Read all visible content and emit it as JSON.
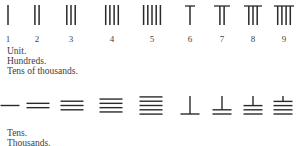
{
  "figure": {
    "vertical_numerals": {
      "digits": [
        1,
        2,
        3,
        4,
        5,
        6,
        7,
        8,
        9
      ],
      "labels": [
        "1",
        "2",
        "3",
        "4",
        "5",
        "6",
        "7",
        "8",
        "9"
      ],
      "captions": [
        "Unit.",
        "Hundreds.",
        "Tens of thousands."
      ]
    },
    "horizontal_numerals": {
      "digits": [
        1,
        2,
        3,
        4,
        5,
        6,
        7,
        8,
        9
      ],
      "captions": [
        "Tens.",
        "Thousands."
      ]
    },
    "stroke_color": "#2a2a2a"
  }
}
